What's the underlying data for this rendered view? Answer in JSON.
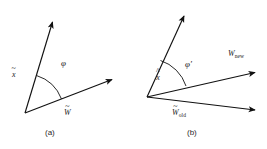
{
  "figure": {
    "background_color": "#ffffff",
    "stroke_color": "#111111",
    "text_color": "#1a1a1a"
  },
  "panels": [
    {
      "id": "a",
      "caption": "(a)",
      "angle_label": "φ",
      "vectors": [
        {
          "name": "x-tilde",
          "base": "x",
          "accent": "~",
          "subscript": ""
        },
        {
          "name": "w-tilde",
          "base": "W",
          "accent": "~",
          "subscript": ""
        }
      ],
      "labels": {
        "x_base": "x",
        "x_accent": "~",
        "w_base": "W",
        "w_accent": "~"
      }
    },
    {
      "id": "b",
      "caption": "(b)",
      "angle_label": "φ′",
      "vectors": [
        {
          "name": "x-hat",
          "base": "x",
          "accent": "^",
          "subscript": ""
        },
        {
          "name": "w-new",
          "base": "W",
          "accent": "",
          "subscript": "new"
        },
        {
          "name": "w-old-tilde",
          "base": "W",
          "accent": "~",
          "subscript": "old"
        }
      ],
      "labels": {
        "x_base": "x",
        "x_accent": "^",
        "wnew_base": "W",
        "wnew_sub": "new",
        "wold_base": "W",
        "wold_accent": "~",
        "wold_sub": "old"
      }
    }
  ]
}
